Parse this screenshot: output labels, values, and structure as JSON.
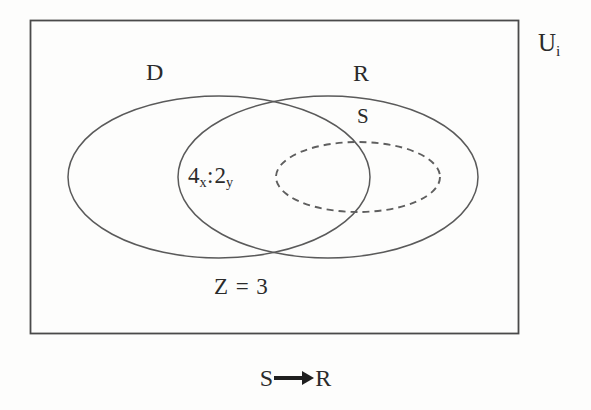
{
  "figure": {
    "type": "venn-diagram",
    "background_color": "#fdfdfc",
    "stroke_color": "#555555",
    "text_color": "#2b2b2b",
    "universe": {
      "label_base": "U",
      "label_subscript": "i",
      "shape": "rectangle",
      "x": 30,
      "y": 20,
      "width": 488,
      "height": 313
    },
    "sets": [
      {
        "name": "D",
        "label": "D",
        "shape": "ellipse",
        "style": "solid",
        "cx": 219,
        "cy": 177,
        "rx": 151,
        "ry": 81
      },
      {
        "name": "R",
        "label": "R",
        "shape": "ellipse",
        "style": "solid",
        "cx": 328,
        "cy": 177,
        "rx": 150,
        "ry": 81
      },
      {
        "name": "S",
        "label": "S",
        "shape": "ellipse",
        "style": "dashed",
        "cx": 358,
        "cy": 177,
        "rx": 82,
        "ry": 35
      }
    ],
    "annotations": {
      "intersection_expression": {
        "first_base": "4",
        "first_subscript": "x",
        "separator": ":",
        "second_base": "2",
        "second_subscript": "y"
      },
      "z_value": "Z = 3"
    },
    "caption": {
      "left_term": "S",
      "arrow": "arrow-right-icon",
      "right_term": "R"
    }
  }
}
